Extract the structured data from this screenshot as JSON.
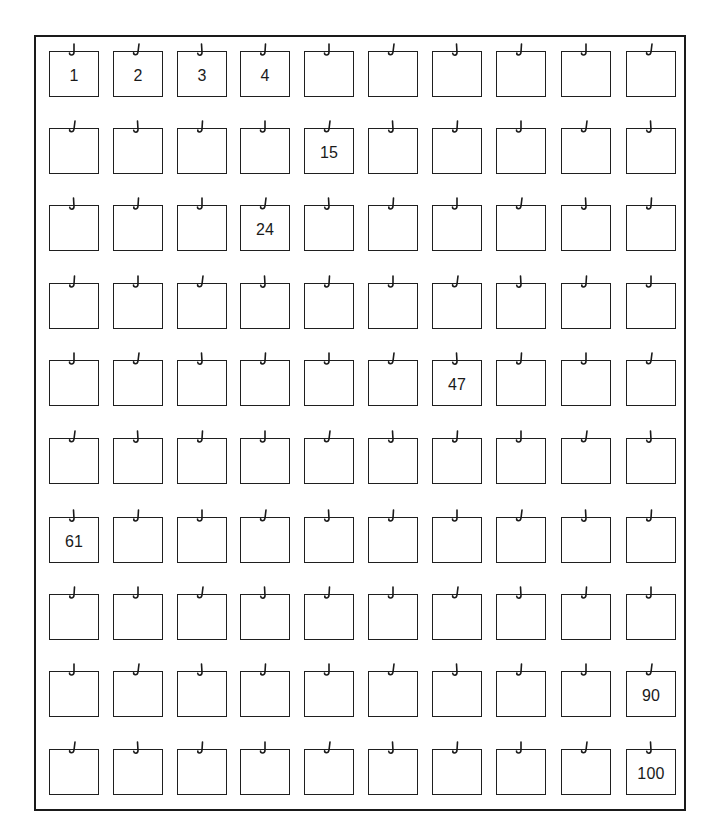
{
  "diagram": {
    "title": "",
    "layout": {
      "rows": 10,
      "columns": 10
    },
    "frame_color": "#1a1a1a",
    "box_icon": "hook-icon",
    "labeled_boxes": [
      {
        "index": 1,
        "label": "1"
      },
      {
        "index": 2,
        "label": "2"
      },
      {
        "index": 3,
        "label": "3"
      },
      {
        "index": 4,
        "label": "4"
      },
      {
        "index": 15,
        "label": "15"
      },
      {
        "index": 24,
        "label": "24"
      },
      {
        "index": 47,
        "label": "47"
      },
      {
        "index": 61,
        "label": "61"
      },
      {
        "index": 90,
        "label": "90"
      },
      {
        "index": 100,
        "label": "100"
      }
    ],
    "boxes": [
      {
        "label": "1"
      },
      {
        "label": "2"
      },
      {
        "label": "3"
      },
      {
        "label": "4"
      },
      {
        "label": ""
      },
      {
        "label": ""
      },
      {
        "label": ""
      },
      {
        "label": ""
      },
      {
        "label": ""
      },
      {
        "label": ""
      },
      {
        "label": ""
      },
      {
        "label": ""
      },
      {
        "label": ""
      },
      {
        "label": ""
      },
      {
        "label": "15"
      },
      {
        "label": ""
      },
      {
        "label": ""
      },
      {
        "label": ""
      },
      {
        "label": ""
      },
      {
        "label": ""
      },
      {
        "label": ""
      },
      {
        "label": ""
      },
      {
        "label": ""
      },
      {
        "label": "24"
      },
      {
        "label": ""
      },
      {
        "label": ""
      },
      {
        "label": ""
      },
      {
        "label": ""
      },
      {
        "label": ""
      },
      {
        "label": ""
      },
      {
        "label": ""
      },
      {
        "label": ""
      },
      {
        "label": ""
      },
      {
        "label": ""
      },
      {
        "label": ""
      },
      {
        "label": ""
      },
      {
        "label": ""
      },
      {
        "label": ""
      },
      {
        "label": ""
      },
      {
        "label": ""
      },
      {
        "label": ""
      },
      {
        "label": ""
      },
      {
        "label": ""
      },
      {
        "label": ""
      },
      {
        "label": ""
      },
      {
        "label": ""
      },
      {
        "label": "47"
      },
      {
        "label": ""
      },
      {
        "label": ""
      },
      {
        "label": ""
      },
      {
        "label": ""
      },
      {
        "label": ""
      },
      {
        "label": ""
      },
      {
        "label": ""
      },
      {
        "label": ""
      },
      {
        "label": ""
      },
      {
        "label": ""
      },
      {
        "label": ""
      },
      {
        "label": ""
      },
      {
        "label": ""
      },
      {
        "label": "61"
      },
      {
        "label": ""
      },
      {
        "label": ""
      },
      {
        "label": ""
      },
      {
        "label": ""
      },
      {
        "label": ""
      },
      {
        "label": ""
      },
      {
        "label": ""
      },
      {
        "label": ""
      },
      {
        "label": ""
      },
      {
        "label": ""
      },
      {
        "label": ""
      },
      {
        "label": ""
      },
      {
        "label": ""
      },
      {
        "label": ""
      },
      {
        "label": ""
      },
      {
        "label": ""
      },
      {
        "label": ""
      },
      {
        "label": ""
      },
      {
        "label": ""
      },
      {
        "label": ""
      },
      {
        "label": ""
      },
      {
        "label": ""
      },
      {
        "label": ""
      },
      {
        "label": ""
      },
      {
        "label": ""
      },
      {
        "label": ""
      },
      {
        "label": ""
      },
      {
        "label": ""
      },
      {
        "label": "90"
      },
      {
        "label": ""
      },
      {
        "label": ""
      },
      {
        "label": ""
      },
      {
        "label": ""
      },
      {
        "label": ""
      },
      {
        "label": ""
      },
      {
        "label": ""
      },
      {
        "label": ""
      },
      {
        "label": ""
      },
      {
        "label": "100"
      }
    ]
  }
}
